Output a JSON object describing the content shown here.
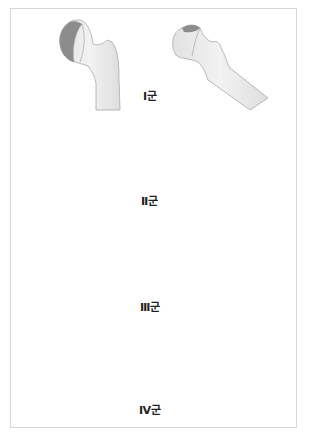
{
  "figure": {
    "colors": {
      "bone_fill": "#ececec",
      "bone_stroke": "#a8a8a8",
      "bone_shadow": "#dcdcdc",
      "necrosis_light": "#8a8a8a",
      "necrosis_dark": "#6e6e6e",
      "frame_border": "#d8d8d8",
      "label_color": "#222222"
    },
    "groups": [
      {
        "label": "Ⅰ군",
        "label_x": 145,
        "label_y": 91
      },
      {
        "label": "Ⅱ군",
        "label_x": 143,
        "label_y": 196
      },
      {
        "label": "Ⅲ군",
        "label_x": 141,
        "label_y": 302
      },
      {
        "label": "Ⅳ군",
        "label_x": 141,
        "label_y": 405
      }
    ]
  }
}
